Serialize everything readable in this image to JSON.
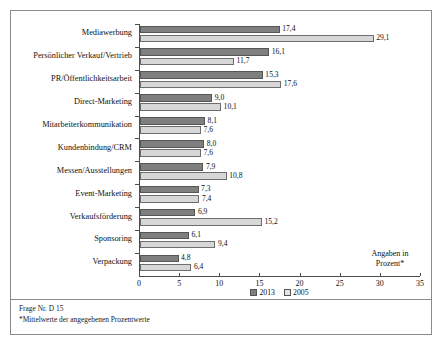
{
  "chart_data": {
    "type": "bar",
    "orientation": "horizontal",
    "title": "",
    "xlabel": "",
    "ylabel": "",
    "xlim": [
      0,
      35
    ],
    "xticks": [
      0,
      5,
      10,
      15,
      20,
      25,
      30,
      35
    ],
    "grid": false,
    "legend_position": "bottom-center",
    "categories": [
      "Mediawerbung",
      "Persönlicher Verkauf/Vertrieb",
      "PR/Öffentlichkeitsarbeit",
      "Direct-Marketing",
      "Mitarbeiterkommunikation",
      "Kundenbindung/CRM",
      "Messen/Ausstellungen",
      "Event-Marketing",
      "Verkaufsförderung",
      "Sponsoring",
      "Verpackung"
    ],
    "series": [
      {
        "name": "2013",
        "color": "#7f7f7f",
        "values": [
          17.4,
          16.1,
          15.3,
          9.0,
          8.1,
          8.0,
          7.9,
          7.3,
          6.9,
          6.1,
          4.8
        ],
        "labels": [
          "17,4",
          "16,1",
          "15,3",
          "9,0",
          "8,1",
          "8,0",
          "7,9",
          "7,3",
          "6,9",
          "6,1",
          "4,8"
        ]
      },
      {
        "name": "2005",
        "color": "#d7d7d7",
        "values": [
          29.1,
          11.7,
          17.6,
          10.1,
          7.6,
          7.6,
          10.8,
          7.4,
          15.2,
          9.4,
          6.4
        ],
        "labels": [
          "29,1",
          "11,7",
          "17,6",
          "10,1",
          "7,6",
          "7,6",
          "10,8",
          "7,4",
          "15,2",
          "9,4",
          "6,4"
        ]
      }
    ],
    "annotation": "Angaben in Prozent*",
    "annotation_lines": [
      "Angaben in",
      "Prozent*"
    ],
    "footnotes": [
      "Frage Nr. D 15",
      "*Mittelwerte der angegebenen Prozentwerte"
    ]
  }
}
